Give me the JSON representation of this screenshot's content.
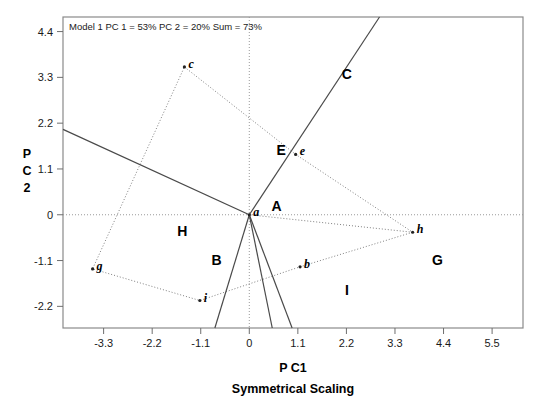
{
  "chart_data": {
    "type": "scatter",
    "title": "Model 1 PC 1 = 53% PC 2 = 20% Sum = 73%",
    "subtitle": "Symmetrical Scaling",
    "xlabel": "P C1",
    "ylabel": "P C 2",
    "ylabel_chars": [
      "P",
      "C",
      "2"
    ],
    "xticks": [
      "-3.3",
      "-2.2",
      "-1.1",
      "0",
      "1.1",
      "2.2",
      "3.3",
      "4.4",
      "5.5"
    ],
    "xtick_values": [
      -3.3,
      -2.2,
      -1.1,
      0,
      1.1,
      2.2,
      3.3,
      4.4,
      5.5
    ],
    "yticks": [
      "4.4",
      "3.3",
      "2.2",
      "1.1",
      "0",
      "-1.1",
      "-2.2"
    ],
    "ytick_values": [
      4.4,
      3.3,
      2.2,
      1.1,
      0,
      -1.1,
      -2.2
    ],
    "xlim": [
      -4.22,
      6.2
    ],
    "ylim": [
      -2.72,
      4.75
    ],
    "grid": false,
    "legend": "none",
    "zero_lines": true,
    "variance_explained": {
      "pc1": "53%",
      "pc2": "20%",
      "sum": "73%"
    },
    "site_points": [
      {
        "name": "a",
        "x": 0.0,
        "y": 0.0
      },
      {
        "name": "b",
        "x": 1.15,
        "y": -1.25
      },
      {
        "name": "c",
        "x": -1.47,
        "y": 3.55
      },
      {
        "name": "e",
        "x": 1.05,
        "y": 1.45
      },
      {
        "name": "g",
        "x": -3.55,
        "y": -1.3
      },
      {
        "name": "h",
        "x": 3.7,
        "y": -0.42
      },
      {
        "name": "i",
        "x": -1.12,
        "y": -2.06
      }
    ],
    "region_labels": [
      {
        "name": "A",
        "x": 0.62,
        "y": 0.08
      },
      {
        "name": "B",
        "x": -0.74,
        "y": -1.2
      },
      {
        "name": "C",
        "x": 2.21,
        "y": 3.25
      },
      {
        "name": "E",
        "x": 0.72,
        "y": 1.44
      },
      {
        "name": "G",
        "x": 4.26,
        "y": -1.2
      },
      {
        "name": "H",
        "x": -1.52,
        "y": -0.52
      },
      {
        "name": "I",
        "x": 2.21,
        "y": -1.93
      }
    ],
    "dotted_hull_path": [
      {
        "x": -1.47,
        "y": 3.55
      },
      {
        "x": 1.05,
        "y": 1.45
      },
      {
        "x": 3.7,
        "y": -0.42
      },
      {
        "x": 1.15,
        "y": -1.25
      },
      {
        "x": -1.12,
        "y": -2.06
      },
      {
        "x": -3.55,
        "y": -1.3
      },
      {
        "x": -1.47,
        "y": 3.55
      }
    ],
    "hull_spoke_segments": [
      {
        "from": {
          "x": 3.7,
          "y": -0.42
        },
        "to": {
          "x": 0.0,
          "y": 0.0
        }
      }
    ],
    "species_vectors": [
      {
        "name": "C",
        "x1": 0.0,
        "y1": 0.0,
        "x2": 2.95,
        "y2": 4.75
      },
      {
        "name": "upper-left",
        "x1": 0.0,
        "y1": 0.0,
        "x2": -4.22,
        "y2": 2.05
      },
      {
        "name": "lower-left",
        "x1": 0.0,
        "y1": 0.0,
        "x2": -0.78,
        "y2": -2.72
      },
      {
        "name": "lower-mid",
        "x1": 0.0,
        "y1": 0.0,
        "x2": 0.52,
        "y2": -2.72
      },
      {
        "name": "lower-right",
        "x1": 0.0,
        "y1": 0.0,
        "x2": 0.97,
        "y2": -2.72
      }
    ]
  }
}
